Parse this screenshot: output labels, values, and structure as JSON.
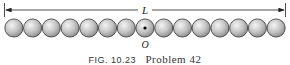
{
  "figure": {
    "length_label": "L",
    "origin_label": "O",
    "ball_count": 15,
    "center_ball_index": 7,
    "caption_fig": "FIG. 10.23",
    "caption_text": "Problem 42"
  },
  "colors": {
    "ball_light": "#f2f2f2",
    "ball_dark": "#8a8a8a",
    "outline": "#333333",
    "line": "#222222"
  }
}
